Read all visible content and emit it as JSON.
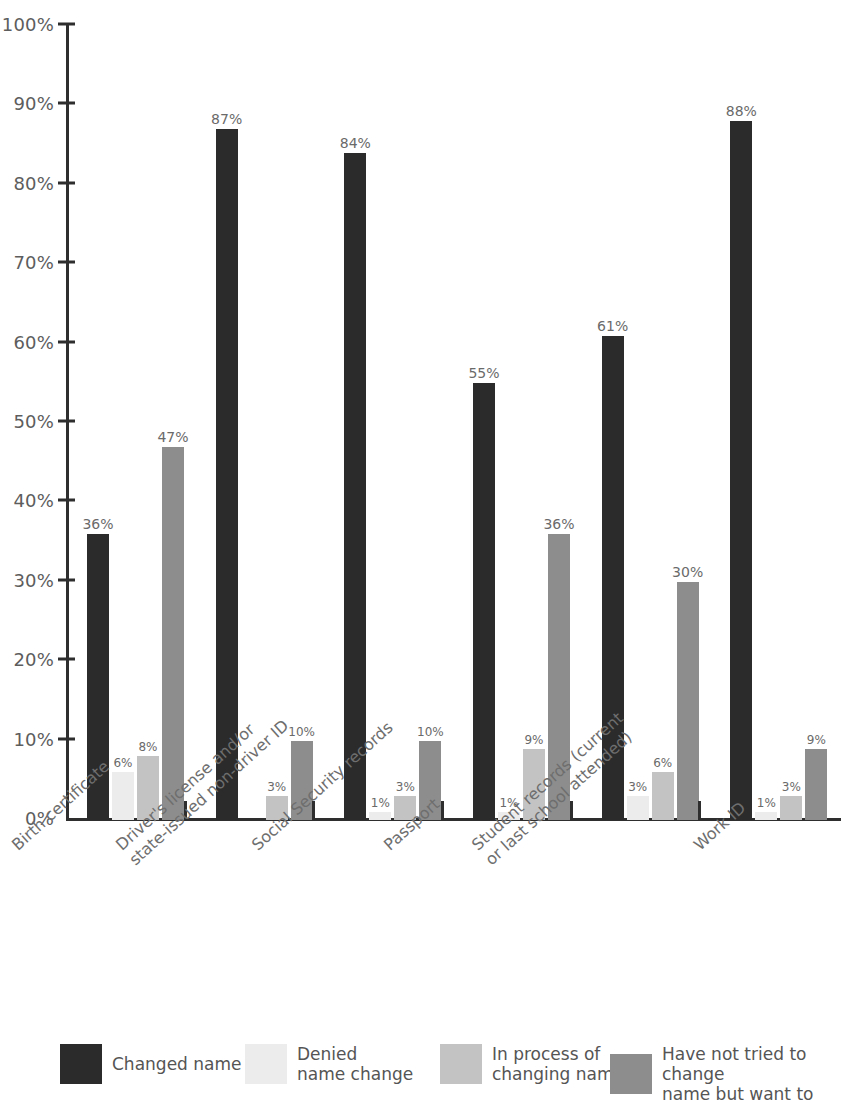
{
  "chart_data": {
    "type": "bar",
    "title": "",
    "subtitle": "",
    "xlabel": "",
    "ylabel": "",
    "ylim": [
      0,
      100
    ],
    "grid": false,
    "legend_position": "bottom",
    "y_ticks": [
      "0%",
      "10%",
      "20%",
      "30%",
      "40%",
      "50%",
      "60%",
      "70%",
      "80%",
      "90%",
      "100%"
    ],
    "y_tick_values": [
      0,
      10,
      20,
      30,
      40,
      50,
      60,
      70,
      80,
      90,
      100
    ],
    "categories": [
      "Birth certificate",
      "Driver's license and/or\nstate-issued non-driver ID",
      "Social Security records",
      "Passport",
      "Student records (current\nor last school attended)",
      "Work ID"
    ],
    "series": [
      {
        "name": "Changed name",
        "color": "#2b2b2b",
        "values": [
          36,
          87,
          84,
          55,
          61,
          88
        ],
        "labels": [
          "36%",
          "87%",
          "84%",
          "55%",
          "61%",
          "88%"
        ]
      },
      {
        "name": "Denied\nname change",
        "color": "#ececec",
        "values": [
          6,
          0,
          1,
          1,
          3,
          1
        ],
        "labels": [
          "6%",
          "",
          "1%",
          "1%",
          "3%",
          "1%"
        ]
      },
      {
        "name": "In process of\nchanging name",
        "color": "#c3c3c3",
        "values": [
          8,
          3,
          3,
          9,
          6,
          3
        ],
        "labels": [
          "8%",
          "3%",
          "3%",
          "9%",
          "6%",
          "3%"
        ]
      },
      {
        "name": "Have not tried to change\nname but want to",
        "color": "#8d8d8d",
        "values": [
          47,
          10,
          10,
          36,
          30,
          9
        ],
        "labels": [
          "47%",
          "10%",
          "10%",
          "36%",
          "30%",
          "9%"
        ]
      }
    ]
  },
  "axis": {
    "y_ticks": [
      {
        "label": "100%",
        "value": 100
      },
      {
        "label": "90%",
        "value": 90
      },
      {
        "label": "80%",
        "value": 80
      },
      {
        "label": "70%",
        "value": 70
      },
      {
        "label": "60%",
        "value": 60
      },
      {
        "label": "50%",
        "value": 50
      },
      {
        "label": "40%",
        "value": 40
      },
      {
        "label": "30%",
        "value": 30
      },
      {
        "label": "20%",
        "value": 20
      },
      {
        "label": "10%",
        "value": 10
      },
      {
        "label": "0%",
        "value": 0
      }
    ]
  },
  "legend": {
    "items": [
      {
        "label": "Changed name",
        "color": "#2b2b2b"
      },
      {
        "label": "Denied\nname change",
        "color": "#ececec"
      },
      {
        "label": "In process of\nchanging name",
        "color": "#c3c3c3"
      },
      {
        "label": "Have not tried to change\nname but want to",
        "color": "#8d8d8d"
      }
    ]
  },
  "colors": {
    "axis": "#2e2e2e",
    "tick_text": "#5d5d5d",
    "value_text": "#6a6a6a",
    "category_text": "#6e6e6e",
    "legend_text": "#555555",
    "background": "#ffffff"
  }
}
